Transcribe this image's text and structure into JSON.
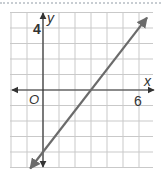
{
  "chart_data": {
    "type": "line",
    "title": "",
    "xlabel": "x",
    "ylabel": "y",
    "origin_label": "O",
    "x_tick_labels": [
      {
        "value": 6,
        "label": "6"
      }
    ],
    "y_tick_labels": [
      {
        "value": 4,
        "label": "4"
      }
    ],
    "xlim": [
      -2,
      7
    ],
    "ylim": [
      -5,
      5
    ],
    "grid": true,
    "series": [
      {
        "name": "line",
        "equation": "y = (4/3)x - 4",
        "slope": 1.3333,
        "intercept": -4,
        "points": [
          {
            "x": 0,
            "y": -4
          },
          {
            "x": 3,
            "y": 0
          },
          {
            "x": 6,
            "y": 4
          }
        ],
        "arrows_both_ends": true,
        "color": "#6b6b6b"
      }
    ],
    "colors": {
      "grid": "#c9c9c9",
      "axes": "#333333",
      "line": "#6b6b6b"
    }
  }
}
